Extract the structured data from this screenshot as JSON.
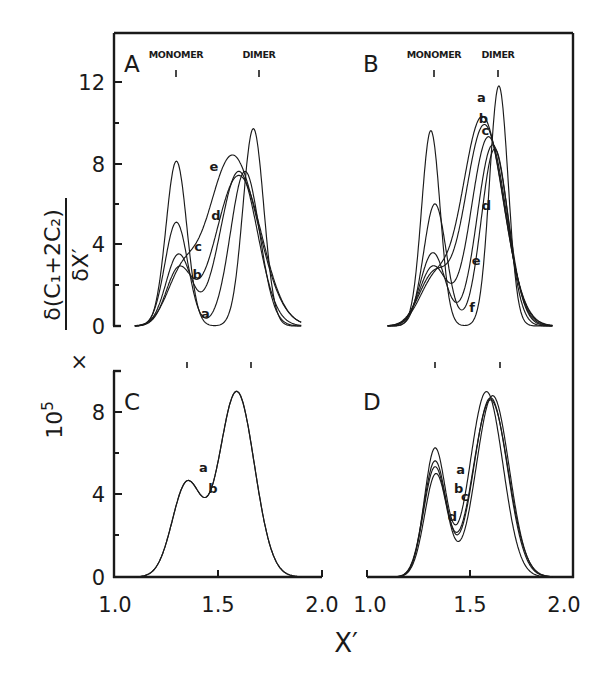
{
  "chart_data": {
    "type": "line",
    "title": "",
    "xlabel": "X′",
    "ylabel": "10⁵ × δ(C₁ + 2C₂) / δX′",
    "ylabel_parts": {
      "scale": "10",
      "scale_exp": "5",
      "times": "×",
      "numerator": "δ(C₁+2C₂)",
      "denominator": "δX′"
    },
    "grid": false,
    "legend": "none (curves labeled inline a–f)",
    "markers": {
      "monomer": "MONOMER",
      "dimer": "DIMER",
      "monomer_x": 1.32,
      "dimer_x": 1.62
    },
    "panels": [
      {
        "id": "A",
        "xlim": [
          1.0,
          2.0
        ],
        "ylim": [
          0,
          14.4
        ],
        "yticks": [
          "0",
          "4",
          "8",
          "12"
        ],
        "yticks_minor": [
          2,
          6,
          10
        ],
        "xticks": [],
        "show_marker_text": true,
        "series": [
          {
            "name": "a",
            "label_at": [
              1.44,
              0.4
            ],
            "peaks": [
              [
                1.3,
                8.1,
                0.05
              ],
              [
                1.67,
                9.7,
                0.05
              ]
            ]
          },
          {
            "name": "b",
            "label_at": [
              1.4,
              2.3
            ],
            "peaks": [
              [
                1.3,
                5.1,
                0.055
              ],
              [
                1.63,
                7.6,
                0.07
              ]
            ]
          },
          {
            "name": "c",
            "label_at": [
              1.405,
              3.7
            ],
            "peaks": [
              [
                1.31,
                3.5,
                0.06
              ],
              [
                1.6,
                7.6,
                0.09
              ]
            ]
          },
          {
            "name": "d",
            "label_at": [
              1.49,
              5.2
            ],
            "peaks": [
              [
                1.31,
                2.7,
                0.06
              ],
              [
                1.6,
                7.4,
                0.11
              ]
            ]
          },
          {
            "name": "e",
            "label_at": [
              1.48,
              7.6
            ],
            "peaks": [
              [
                1.32,
                2.1,
                0.07
              ],
              [
                1.57,
                8.4,
                0.12
              ]
            ]
          }
        ],
        "peak_values_read": {
          "monomer_peak_max": 8.1,
          "dimer_peak_max": 9.7,
          "isosbestic": [
            1.355,
            3.6
          ]
        }
      },
      {
        "id": "B",
        "xlim": [
          1.0,
          2.0
        ],
        "ylim": [
          0,
          14.4
        ],
        "yticks": [],
        "xticks": [],
        "show_marker_text": true,
        "series": [
          {
            "name": "a",
            "label_at": [
              1.555,
              11.0
            ],
            "peaks": [
              [
                1.32,
                2.0,
                0.07
              ],
              [
                1.56,
                10.3,
                0.1
              ]
            ]
          },
          {
            "name": "b",
            "label_at": [
              1.565,
              10.0
            ],
            "peaks": [
              [
                1.32,
                2.4,
                0.07
              ],
              [
                1.57,
                9.9,
                0.095
              ]
            ]
          },
          {
            "name": "c",
            "label_at": [
              1.575,
              9.4
            ],
            "peaks": [
              [
                1.32,
                2.9,
                0.065
              ],
              [
                1.59,
                9.3,
                0.085
              ]
            ]
          },
          {
            "name": "d",
            "label_at": [
              1.58,
              5.7
            ],
            "peaks": [
              [
                1.32,
                3.6,
                0.06
              ],
              [
                1.61,
                8.9,
                0.075
              ]
            ]
          },
          {
            "name": "e",
            "label_at": [
              1.53,
              3.0
            ],
            "peaks": [
              [
                1.33,
                6.0,
                0.055
              ],
              [
                1.62,
                8.7,
                0.065
              ]
            ]
          },
          {
            "name": "f",
            "label_at": [
              1.51,
              0.7
            ],
            "peaks": [
              [
                1.31,
                9.6,
                0.045
              ],
              [
                1.64,
                11.8,
                0.045
              ]
            ]
          }
        ],
        "peak_values_read": {
          "monomer_peak_max": 9.6,
          "dimer_peak_max": 11.8,
          "isosbestic": [
            1.36,
            4.3
          ]
        }
      },
      {
        "id": "C",
        "xlim": [
          1.0,
          2.0
        ],
        "ylim": [
          0,
          10.1
        ],
        "yticks": [
          "0",
          "4",
          "8"
        ],
        "yticks_minor": [
          2,
          6
        ],
        "xticks": [
          "1.0",
          "1.5",
          "2.0"
        ],
        "show_marker_text": false,
        "series": [
          {
            "name": "a",
            "label_at": [
              1.43,
              5.1
            ],
            "peaks": [
              [
                1.35,
                4.5,
                0.07
              ],
              [
                1.59,
                9.0,
                0.085
              ]
            ]
          },
          {
            "name": "b",
            "label_at": [
              1.475,
              4.1
            ],
            "peaks": [
              [
                1.35,
                4.5,
                0.07
              ],
              [
                1.59,
                9.0,
                0.085
              ]
            ]
          }
        ],
        "peak_values_read": {
          "shoulder": [
            1.4,
            4.7
          ],
          "peak": [
            1.58,
            9.0
          ]
        }
      },
      {
        "id": "D",
        "xlim": [
          1.0,
          2.0
        ],
        "ylim": [
          0,
          10.1
        ],
        "yticks": [],
        "xticks": [
          "1.0",
          "1.5",
          "2.0"
        ],
        "show_marker_text": false,
        "series": [
          {
            "name": "a",
            "label_at": [
              1.455,
              5.0
            ],
            "peaks": [
              [
                1.33,
                5.3,
                0.055
              ],
              [
                1.6,
                8.6,
                0.085
              ]
            ]
          },
          {
            "name": "b",
            "label_at": [
              1.445,
              4.1
            ],
            "peaks": [
              [
                1.33,
                5.6,
                0.055
              ],
              [
                1.6,
                8.7,
                0.082
              ]
            ]
          },
          {
            "name": "c",
            "label_at": [
              1.475,
              3.7
            ],
            "peaks": [
              [
                1.33,
                6.2,
                0.052
              ],
              [
                1.58,
                9.0,
                0.08
              ]
            ]
          },
          {
            "name": "d",
            "label_at": [
              1.415,
              2.7
            ],
            "peaks": [
              [
                1.335,
                5.0,
                0.055
              ],
              [
                1.61,
                8.8,
                0.08
              ]
            ]
          }
        ],
        "peak_values_read": {
          "monomer_peak_max": 6.2,
          "dimer_peak_max": 9.0
        }
      }
    ]
  },
  "figure": {
    "panel_letters": [
      "A",
      "B",
      "C",
      "D"
    ],
    "x_tick_labels": [
      "1.0",
      "1.5",
      "2.0"
    ],
    "y_tick_labels_top": [
      "12",
      "8",
      "4",
      "0"
    ],
    "y_tick_labels_bottom": [
      "8",
      "4",
      "0"
    ],
    "xlabel": "X′",
    "monomer_label": "MONOMER",
    "dimer_label": "DIMER"
  }
}
